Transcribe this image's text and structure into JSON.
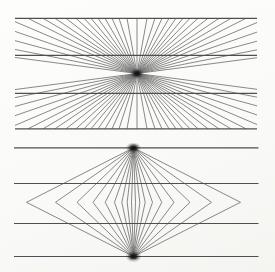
{
  "canvas": {
    "width": 275,
    "height": 272,
    "background_top": "#fdfdfc",
    "background_bottom": "#f4f4f1"
  },
  "colors": {
    "ray_line": "#6b6b6b",
    "horizontal_line": "#4f4f4f",
    "ink_blob": "#141414"
  },
  "strokes": {
    "ray_width": 0.8,
    "horizontal_width": 1.15
  },
  "hering_figure": {
    "box": {
      "left": 15,
      "right": 257,
      "top": 18.3,
      "bottom": 128.8
    },
    "center": {
      "x": 137,
      "y": 73.5
    },
    "horizontal_line_ys": [
      18.3,
      55.4,
      93.3,
      128.8
    ],
    "ray_edge_offsets": [
      0,
      10,
      18,
      25,
      32,
      39,
      46,
      53,
      61,
      71,
      82,
      94,
      109,
      130,
      160,
      205,
      280,
      420
    ],
    "blob": {
      "x": 137,
      "y": 73.5,
      "rx": 4.8,
      "ry": 3.6
    }
  },
  "wundt_figure": {
    "extent": {
      "left": 14,
      "right": 258.5
    },
    "center_x": 133.5,
    "top_vertex_y": 147.8,
    "bottom_vertex_y": 256.5,
    "mid_y": 202.3,
    "lens_offsets": [
      2,
      6.3,
      11.7,
      19,
      28.3,
      40.5,
      56.5,
      78,
      107
    ],
    "horizontal_line_ys": [
      147.8,
      183.5,
      223.5,
      256.5
    ],
    "top_blob": {
      "rx": 5.4,
      "ry": 3.8
    },
    "bottom_blob": {
      "rx": 5.6,
      "ry": 3.8
    }
  },
  "blob_layers": [
    {
      "scale": 1.35,
      "opacity": 0.16
    },
    {
      "scale": 1.0,
      "opacity": 0.38
    },
    {
      "scale": 0.68,
      "opacity": 0.68
    },
    {
      "scale": 0.42,
      "opacity": 0.95
    }
  ]
}
